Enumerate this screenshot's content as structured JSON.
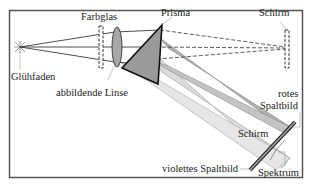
{
  "labels": {
    "farbglas": "Farbglas",
    "prisma": "Prisma",
    "schirm_top": "Schirm",
    "gluehfaden": "Glühfaden",
    "linse": "abbildende Linse",
    "rotes": "rotes",
    "spaltbild": "Spaltbild",
    "schirm_bottom": "Schirm",
    "violettes": "violettes Spaltbild",
    "spektrum": "Spektrum"
  },
  "colors": {
    "frame": "#555555",
    "line": "#222222",
    "prism_fill": "#9a9a9a",
    "beam_dark": "#b0b0b0",
    "beam_light": "#dcdcdc"
  }
}
